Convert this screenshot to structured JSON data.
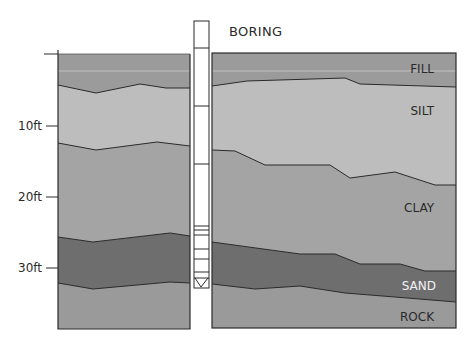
{
  "title": "BORING",
  "axis": {
    "ticks": [
      {
        "label": "10ft",
        "y": 126
      },
      {
        "label": "20ft",
        "y": 197
      },
      {
        "label": "30ft",
        "y": 268
      }
    ]
  },
  "layers": [
    {
      "name": "FILL",
      "color": "#9b9b9b",
      "label_color": "#2a2a2a"
    },
    {
      "name": "SILT",
      "color": "#bdbdbd",
      "label_color": "#2a2a2a"
    },
    {
      "name": "CLAY",
      "color": "#a4a4a4",
      "label_color": "#2a2a2a"
    },
    {
      "name": "SAND",
      "color": "#6e6e6e",
      "label_color": "#f2f2f2"
    },
    {
      "name": "ROCK",
      "color": "#9a9a9a",
      "label_color": "#2a2a2a"
    }
  ],
  "labels": {
    "fill": "FILL",
    "silt": "SILT",
    "clay": "CLAY",
    "sand": "SAND",
    "rock": "ROCK"
  },
  "axis_labels": {
    "t10": "10ft",
    "t20": "20ft",
    "t30": "30ft"
  },
  "colors": {
    "fill": "#9b9b9b",
    "silt": "#bdbdbd",
    "clay": "#a4a4a4",
    "sand": "#6e6e6e",
    "rock": "#9a9a9a",
    "line": "#2b2b2b",
    "pipe": "#ffffff"
  }
}
